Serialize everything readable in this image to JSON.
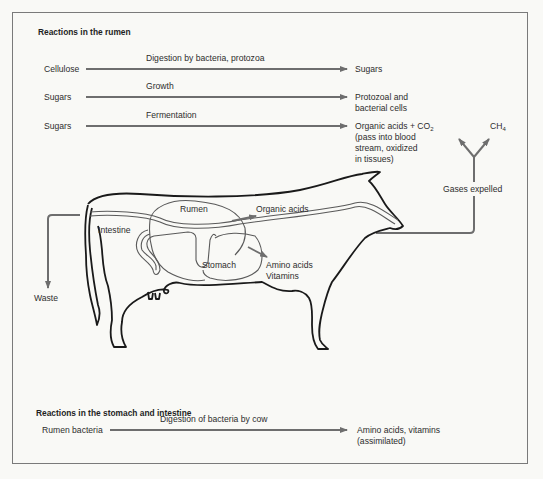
{
  "rumen_section": {
    "heading": "Reactions in the rumen",
    "reactions": [
      {
        "input": "Cellulose",
        "process": "Digestion by bacteria, protozoa",
        "output_lines": [
          "Sugars"
        ]
      },
      {
        "input": "Sugars",
        "process": "Growth",
        "output_lines": [
          "Protozoal and",
          "bacterial cells"
        ]
      },
      {
        "input": "Sugars",
        "process": "Fermentation",
        "output_lines": [
          "Organic acids + CO",
          "(pass into blood",
          "stream, oxidized",
          "in tissues)"
        ],
        "output_subscript": "2"
      }
    ]
  },
  "gases": {
    "methane": "CH",
    "methane_subscript": "4",
    "label": "Gases expelled"
  },
  "cow_labels": {
    "rumen": "Rumen",
    "intestine": "Intestine",
    "stomach": "Stomach",
    "organic_acids": "Organic acids",
    "amino_acids": "Amino acids",
    "vitamins": "Vitamins",
    "waste": "Waste"
  },
  "stomach_section": {
    "heading": "Reactions in the stomach and intestine",
    "reactions": [
      {
        "input": "Rumen bacteria",
        "process": "Digestion of bacteria by cow",
        "output_lines": [
          "Amino acids, vitamins",
          "(assimilated)"
        ]
      }
    ]
  },
  "colors": {
    "arrow": "#6e6e6e",
    "outline": "#1a1a1a",
    "frame": "#7a7a7a",
    "background": "#f9f9f6"
  }
}
